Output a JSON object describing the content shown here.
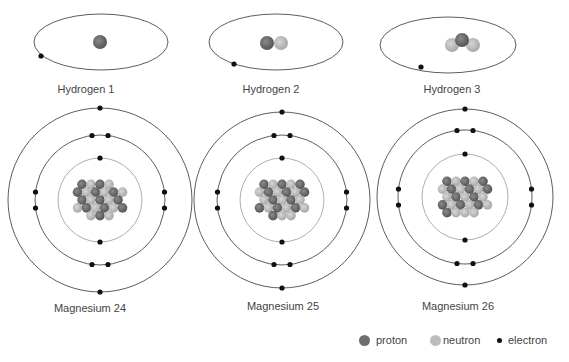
{
  "colors": {
    "proton": "#6e6e6e",
    "neutron": "#bdbdbd",
    "electron": "#111111",
    "orbit": "#333333",
    "inner_orbit": "#999999"
  },
  "atoms": [
    {
      "name": "Hydrogen 1",
      "protons": 1,
      "neutrons": 0,
      "electrons": 1
    },
    {
      "name": "Hydrogen 2",
      "protons": 1,
      "neutrons": 1,
      "electrons": 1
    },
    {
      "name": "Hydrogen 3",
      "protons": 1,
      "neutrons": 2,
      "electrons": 1
    },
    {
      "name": "Magnesium 24",
      "protons": 12,
      "neutrons": 12,
      "electrons": 12,
      "shells": [
        2,
        8,
        2
      ]
    },
    {
      "name": "Magnesium 25",
      "protons": 12,
      "neutrons": 13,
      "electrons": 12,
      "shells": [
        2,
        8,
        2
      ]
    },
    {
      "name": "Magnesium 26",
      "protons": 12,
      "neutrons": 14,
      "electrons": 12,
      "shells": [
        2,
        8,
        2
      ]
    }
  ],
  "legend": {
    "proton": "proton",
    "neutron": "neutron",
    "electron": "electron"
  }
}
